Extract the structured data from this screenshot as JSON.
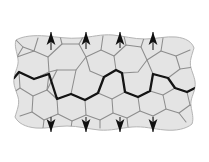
{
  "figure": {
    "colors": {
      "background": "#ffffff",
      "grain_fill": "#e4e4e4",
      "grain_boundary": "#8d8d8d",
      "specimen_outline": "#b4b4b4",
      "crack": "#141414",
      "arrow": "#101010"
    }
  },
  "specimen": {
    "name": "polycrystalline-specimen",
    "outline_path": "M 16 40 C 23 36 34 35 46 36 C 58 37 68 39 80 38 C 92 37 101 34 113 35 C 124 36 133 39 145 39 C 156 39 166 36 176 37 C 186 38 192 42 194 48 C 192 55 189 61 191 68 C 193 75 196 80 195 87 C 194 94 190 99 191 106 C 192 113 194 118 192 124 C 186 129 176 131 165 130 C 153 129 144 126 132 127 C 120 128 111 131 99 130 C 88 129 79 126 67 126 C 56 126 46 129 36 128 C 25 127 18 123 15 117 C 17 110 20 104 18 97 C 16 90 13 85 14 78 C 15 71 19 66 18 59 C 17 52 14 46 16 40 Z",
    "fill": "#e4e4e4"
  },
  "grain_boundaries": {
    "name": "grain-boundary-network",
    "description": "Irregular polygonal grain boundaries forming a polycrystalline microstructure",
    "segments": [
      "M 17 57 L 34 51 L 48 57 L 49 72 L 34 79 L 19 72",
      "M 34 51 L 38 38",
      "M 48 57 L 62 44 L 79 44 L 86 57 L 76 70 L 57 70 L 49 72",
      "M 62 44 L 60 36",
      "M 79 44 L 83 37",
      "M 86 57 L 101 50 L 114 56 L 116 70 L 104 77 L 90 71 L 86 57",
      "M 101 50 L 103 36",
      "M 114 56 L 126 45 L 141 47 L 147 60 L 138 72 L 122 73 L 116 70",
      "M 126 45 L 124 36",
      "M 141 47 L 144 38",
      "M 147 60 L 161 51 L 176 56 L 180 69 L 168 78 L 153 74 L 147 60",
      "M 161 51 L 163 38",
      "M 176 56 L 190 50",
      "M 180 69 L 194 67",
      "M 19 72 L 20 88 L 33 96 L 47 90 L 49 74",
      "M 20 88 L 14 92",
      "M 33 96 L 32 112 L 44 120 L 58 114 L 57 99 L 47 90",
      "M 32 112 L 20 116",
      "M 44 120 L 43 128",
      "M 58 114 L 72 121 L 86 115 L 85 100 L 71 94 L 57 99",
      "M 72 121 L 71 128",
      "M 86 115 L 100 120 L 113 113 L 112 99 L 98 93 L 85 100",
      "M 100 120 L 100 128",
      "M 113 113 L 127 118 L 140 111 L 138 97 L 125 92 L 112 99",
      "M 127 118 L 128 127",
      "M 140 111 L 153 116 L 166 109 L 163 95 L 150 91 L 138 97",
      "M 153 116 L 154 126",
      "M 166 109 L 179 113 L 190 105 L 187 92 L 175 88 L 163 95",
      "M 179 113 L 186 122",
      "M 190 105 L 194 107",
      "M 187 92 L 195 88",
      "M 175 88 L 168 78",
      "M 150 91 L 153 74",
      "M 125 92 L 122 73",
      "M 98 93 L 104 77",
      "M 71 94 L 76 70",
      "M 47 90 L 57 70",
      "M 14 78 L 19 72",
      "M 16 40 L 23 47 L 17 57",
      "M 23 47 L 34 51"
    ]
  },
  "crack": {
    "name": "intergranular-crack-path",
    "label": "crack propagating along grain boundaries",
    "path": "M 14 78 L 19 72 L 34 79 L 49 74 L 57 99 L 71 94 L 85 100 L 98 93 L 104 77 L 116 70 L 122 73 L 125 92 L 138 97 L 150 91 L 153 74 L 168 78 L 175 88 L 187 92 L 195 88"
  },
  "load_arrows": {
    "name": "applied-tensile-load",
    "top": {
      "direction": "up",
      "count": 4,
      "positions": [
        {
          "x": 51,
          "shaft_top": 32,
          "shaft_bottom": 50
        },
        {
          "x": 86,
          "shaft_top": 32,
          "shaft_bottom": 49
        },
        {
          "x": 120,
          "shaft_top": 32,
          "shaft_bottom": 48
        },
        {
          "x": 153,
          "shaft_top": 32,
          "shaft_bottom": 50
        }
      ]
    },
    "bottom": {
      "direction": "down",
      "count": 4,
      "positions": [
        {
          "x": 51,
          "shaft_top": 117,
          "shaft_bottom": 132
        },
        {
          "x": 86,
          "shaft_top": 117,
          "shaft_bottom": 132
        },
        {
          "x": 120,
          "shaft_top": 117,
          "shaft_bottom": 132
        },
        {
          "x": 153,
          "shaft_top": 117,
          "shaft_bottom": 132
        }
      ]
    },
    "head": {
      "half_width": 4.4,
      "length": 13
    }
  }
}
